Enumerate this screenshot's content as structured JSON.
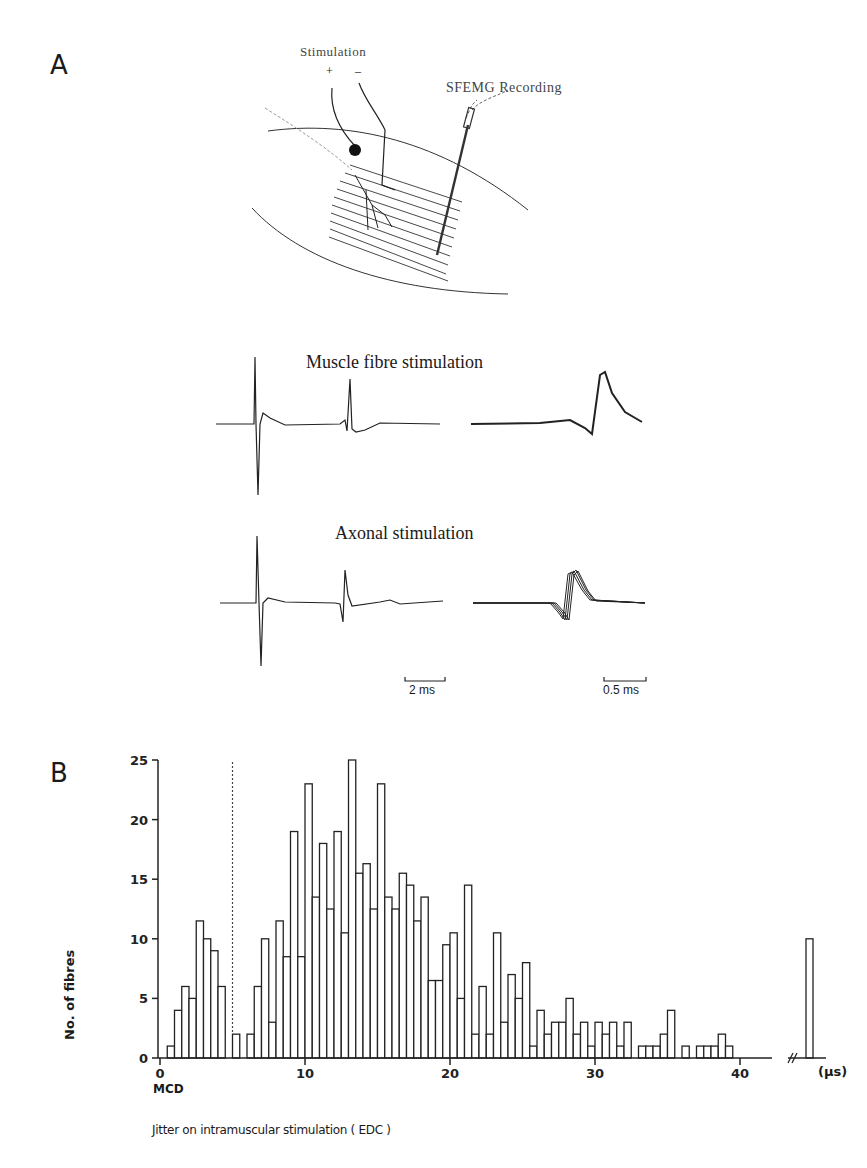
{
  "panel_a": {
    "letter": "A",
    "diagram": {
      "stimulation_label": "Stimulation",
      "plus_label": "+",
      "minus_label": "–",
      "recording_label": "SFEMG Recording"
    },
    "traces": {
      "muscle_title": "Muscle fibre stimulation",
      "axonal_title": "Axonal stimulation",
      "scale_left": "2 ms",
      "scale_right": "0.5 ms"
    }
  },
  "panel_b": {
    "letter": "B"
  },
  "chart_data": {
    "type": "bar",
    "title": "",
    "xlabel": "Jitter on intramuscular stimulation ( EDC )",
    "ylabel": "No. of fibres",
    "x_unit_label": "(µs)",
    "x_ticks": [
      "0",
      "10",
      "20",
      "30",
      "40"
    ],
    "x_tick_values": [
      0,
      10,
      20,
      30,
      40
    ],
    "y_ticks": [
      "0",
      "5",
      "10",
      "15",
      "20",
      "25"
    ],
    "y_tick_values": [
      0,
      5,
      10,
      15,
      20,
      25
    ],
    "ylim": [
      0,
      25
    ],
    "xlim": [
      0,
      42
    ],
    "bin_width": 0.5,
    "annotation_mcd": "MCD",
    "mcd_line_x": 5,
    "axis_break_after": 40,
    "bins_start": [
      0.0,
      0.5,
      1.0,
      1.5,
      2.0,
      2.5,
      3.0,
      3.5,
      4.0,
      4.5,
      5.0,
      5.5,
      6.0,
      6.5,
      7.0,
      7.5,
      8.0,
      8.5,
      9.0,
      9.5,
      10.0,
      10.5,
      11.0,
      11.5,
      12.0,
      12.5,
      13.0,
      13.5,
      14.0,
      14.5,
      15.0,
      15.5,
      16.0,
      16.5,
      17.0,
      17.5,
      18.0,
      18.5,
      19.0,
      19.5,
      20.0,
      20.5,
      21.0,
      21.5,
      22.0,
      22.5,
      23.0,
      23.5,
      24.0,
      24.5,
      25.0,
      25.5,
      26.0,
      26.5,
      27.0,
      27.5,
      28.0,
      28.5,
      29.0,
      29.5,
      30.0,
      30.5,
      31.0,
      31.5,
      32.0,
      32.5,
      33.0,
      33.5,
      34.0,
      34.5,
      35.0,
      35.5,
      36.0,
      36.5,
      37.0,
      37.5,
      38.0,
      38.5,
      39.0,
      39.5
    ],
    "values": [
      0,
      1,
      4,
      6,
      5,
      11.5,
      10,
      9,
      6,
      0,
      2,
      0,
      2,
      6,
      10,
      3,
      11.5,
      8.5,
      19,
      8.5,
      23,
      13.5,
      18,
      12.5,
      19,
      10.5,
      25,
      15.5,
      16.3,
      12.5,
      23,
      13.5,
      12.5,
      15.5,
      14.5,
      11.5,
      13.5,
      6.5,
      6.5,
      9.5,
      10.5,
      5,
      14.5,
      2,
      6,
      2,
      10.5,
      3,
      7,
      5,
      8,
      1,
      4,
      2,
      3,
      3,
      5,
      2,
      3,
      1,
      3,
      2,
      3,
      1,
      3,
      0,
      1,
      1,
      1,
      2,
      4,
      0,
      1,
      0,
      1,
      1,
      1,
      2,
      1,
      0
    ],
    "overflow_bin": {
      "label": ">40",
      "value": 10
    },
    "grid": false,
    "legend": null
  }
}
